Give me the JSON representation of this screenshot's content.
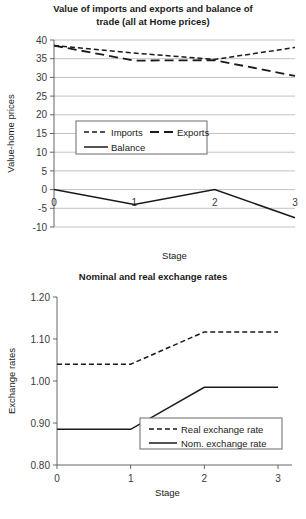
{
  "chart_data": [
    {
      "type": "line",
      "id": "imports-exports-balance",
      "title": "Value of imports and exports and balance of trade (all at Home prices)",
      "title_line1": "Value of imports and exports and balance of",
      "title_line2": "trade (all at Home prices)",
      "xlabel": "Stage",
      "ylabel": "Value-home prices",
      "x": [
        0,
        1,
        2,
        3
      ],
      "categories": [
        "0",
        "1",
        "2",
        "3"
      ],
      "xticklabels": [
        "0",
        "1",
        "2",
        "3"
      ],
      "yticklabels": [
        "-10",
        "-5",
        "0",
        "5",
        "10",
        "15",
        "20",
        "25",
        "30",
        "35",
        "40"
      ],
      "yticks": [
        -10,
        -5,
        0,
        5,
        10,
        15,
        20,
        25,
        30,
        35,
        40
      ],
      "ylim": [
        -10,
        40
      ],
      "xlim": [
        0,
        3
      ],
      "grid": true,
      "legend_position": "center-left",
      "series": [
        {
          "name": "Imports",
          "style": "dashed-short",
          "values": [
            38.5,
            36.5,
            34.8,
            38.0
          ]
        },
        {
          "name": "Exports",
          "style": "dashed-long",
          "values": [
            38.5,
            34.5,
            34.6,
            30.4
          ]
        },
        {
          "name": "Balance",
          "style": "solid",
          "values": [
            0.0,
            -4.0,
            0.0,
            -7.5
          ]
        }
      ]
    },
    {
      "type": "line",
      "id": "nominal-real-exchange-rates",
      "title": "Nominal and real exchange rates",
      "xlabel": "Stage",
      "ylabel": "Exchange rates",
      "x": [
        0,
        1,
        2,
        3
      ],
      "categories": [
        "0",
        "1",
        "2",
        "3"
      ],
      "xticklabels": [
        "0",
        "1",
        "2",
        "3"
      ],
      "yticklabels": [
        "0.80",
        "0.90",
        "1.00",
        "1.10",
        "1.20"
      ],
      "yticks": [
        0.8,
        0.9,
        1.0,
        1.1,
        1.2
      ],
      "ylim": [
        0.8,
        1.2
      ],
      "xlim": [
        0,
        3
      ],
      "grid": false,
      "legend_position": "bottom-right",
      "series": [
        {
          "name": "Real exchange rate",
          "style": "dashed-short",
          "values": [
            1.04,
            1.04,
            1.117,
            1.117
          ]
        },
        {
          "name": "Nom. exchange rate",
          "style": "solid",
          "values": [
            0.885,
            0.885,
            0.985,
            0.985
          ]
        }
      ]
    }
  ],
  "colors": {
    "ink": "#1a1a1a",
    "grid": "#a8a8a8",
    "axis": "#555555",
    "background": "#ffffff"
  }
}
